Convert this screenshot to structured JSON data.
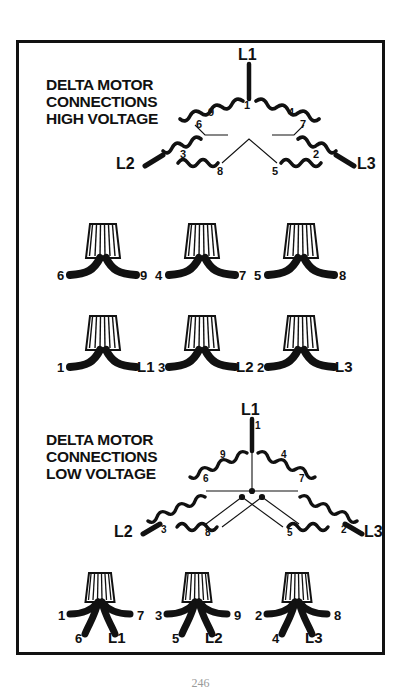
{
  "page": {
    "page_number": "246",
    "border_color": "#111111",
    "background": "#ffffff",
    "ink_color": "#111111"
  },
  "sections": {
    "high_voltage": {
      "title_lines": [
        "DELTA MOTOR",
        "CONNECTIONS",
        "HIGH VOLTAGE"
      ],
      "title_text": "DELTA MOTOR\nCONNECTIONS\nHIGH VOLTAGE",
      "diagram": {
        "type": "delta-winding-schematic",
        "line_terminals": [
          "L1",
          "L2",
          "L3"
        ],
        "coil_tap_numbers": [
          "1",
          "9",
          "4",
          "6",
          "7",
          "3",
          "2",
          "8",
          "5"
        ],
        "internal_jumpers": [
          {
            "from": "6",
            "to": "9"
          },
          {
            "from": "4",
            "to": "7"
          },
          {
            "from": "8",
            "to": "5"
          }
        ]
      }
    },
    "low_voltage": {
      "title_lines": [
        "DELTA MOTOR",
        "CONNECTIONS",
        "LOW VOLTAGE"
      ],
      "title_text": "DELTA MOTOR\nCONNECTIONS\nLOW VOLTAGE",
      "diagram": {
        "type": "delta-winding-schematic",
        "line_terminals": [
          "L1",
          "L2",
          "L3"
        ],
        "coil_tap_numbers": [
          "1",
          "9",
          "4",
          "6",
          "7",
          "3",
          "2",
          "8",
          "5"
        ],
        "junction_dot_count": 3
      }
    }
  },
  "wirenut_rows": {
    "high_voltage_row_1": {
      "groups": [
        {
          "left_label": "6",
          "right_label": "9",
          "wire_count": 2
        },
        {
          "left_label": "4",
          "right_label": "7",
          "wire_count": 2
        },
        {
          "left_label": "5",
          "right_label": "8",
          "wire_count": 2
        }
      ]
    },
    "high_voltage_row_2": {
      "groups": [
        {
          "left_label": "1",
          "right_label": "L1",
          "wire_count": 2
        },
        {
          "left_label": "3",
          "right_label": "L2",
          "wire_count": 2
        },
        {
          "left_label": "2",
          "right_label": "L3",
          "wire_count": 2
        }
      ]
    },
    "low_voltage_row_1": {
      "groups": [
        {
          "upper_left_label": "1",
          "upper_right_label": "7",
          "lower_left_label": "6",
          "lower_right_label": "L1",
          "wire_count": 4
        },
        {
          "upper_left_label": "3",
          "upper_right_label": "9",
          "lower_left_label": "5",
          "lower_right_label": "L2",
          "wire_count": 4
        },
        {
          "upper_left_label": "2",
          "upper_right_label": "8",
          "lower_left_label": "4",
          "lower_right_label": "L3",
          "wire_count": 4
        }
      ]
    }
  }
}
